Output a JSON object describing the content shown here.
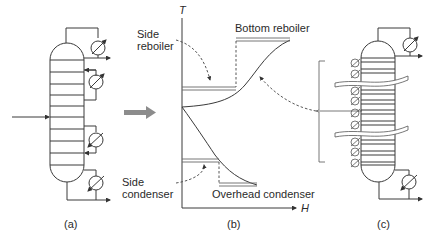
{
  "panels": {
    "a": {
      "caption": "(a)"
    },
    "b": {
      "caption": "(b)",
      "y_axis_label": "T",
      "x_axis_label": "H",
      "labels": {
        "side_reboiler": "Side\nreboiler",
        "bottom_reboiler": "Bottom reboiler",
        "side_condenser": "Side\ncondenser",
        "overhead_condenser": "Overhead condenser"
      }
    },
    "c": {
      "caption": "(c)"
    }
  },
  "colors": {
    "line": "#3a3a3a",
    "arrow_fill": "#8c8c8c"
  }
}
